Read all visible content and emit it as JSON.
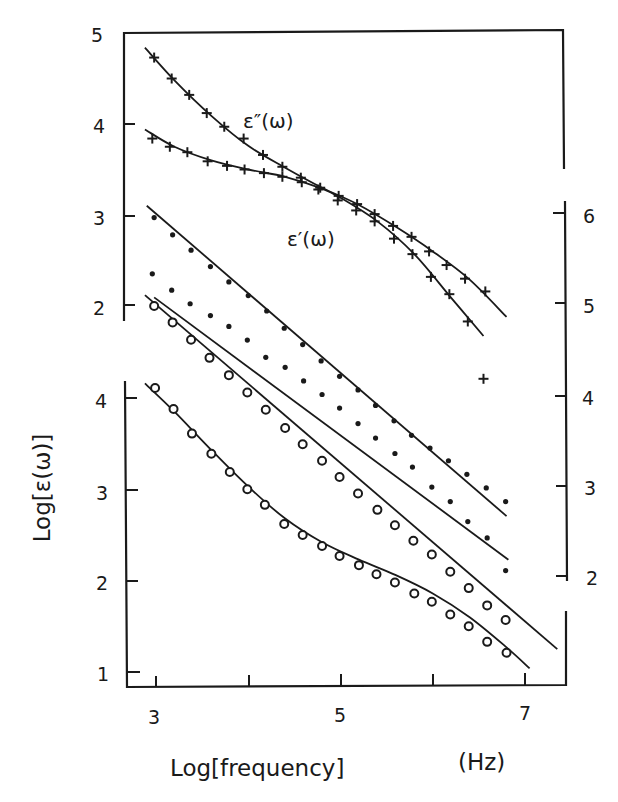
{
  "chart_data": {
    "type": "scatter",
    "title": "",
    "xlabel": "Log[frequency]",
    "xunit": "(Hz)",
    "ylabel": "Log[ε(ω)]",
    "xlim": [
      2.9,
      7.45
    ],
    "x_ticks": [
      3,
      4,
      5,
      6,
      7
    ],
    "x_tick_labels": [
      "3",
      "5",
      "7"
    ],
    "grid": false,
    "legend": "inline curve labels",
    "axes": {
      "left_upper": {
        "ticks": [
          5,
          4,
          3,
          2
        ],
        "labels": [
          "5",
          "4",
          "3",
          "2"
        ],
        "ylim": [
          1.85,
          5
        ]
      },
      "left_lower": {
        "ticks": [
          4,
          3,
          2,
          1
        ],
        "labels": [
          "4",
          "3",
          "2",
          "1"
        ],
        "ylim": [
          0.83,
          4.2
        ]
      },
      "right": {
        "ticks": [
          6,
          5,
          4,
          3,
          2
        ],
        "labels": [
          "6",
          "5",
          "4",
          "3",
          "2"
        ]
      }
    },
    "annotations": [
      "ε″(ω)",
      "ε′(ω)"
    ],
    "series": [
      {
        "name": "ε″(ω)",
        "marker": "cross",
        "axis": "left_upper",
        "x": [
          2.98,
          3.17,
          3.36,
          3.55,
          3.74,
          3.95,
          4.16,
          4.37,
          4.57,
          4.78,
          4.98,
          5.18,
          5.37,
          5.57,
          5.77,
          5.96,
          6.15,
          6.35,
          6.57
        ],
        "y": [
          4.73,
          4.5,
          4.32,
          4.12,
          3.97,
          3.84,
          3.66,
          3.53,
          3.41,
          3.3,
          3.21,
          3.12,
          3.01,
          2.88,
          2.76,
          2.6,
          2.45,
          2.3,
          2.16
        ],
        "fit": {
          "x": [
            2.88,
            3.2,
            3.6,
            4.0,
            4.4,
            4.8,
            5.2,
            5.6,
            6.0,
            6.4,
            6.8
          ],
          "y": [
            4.84,
            4.48,
            4.09,
            3.76,
            3.52,
            3.3,
            3.11,
            2.87,
            2.6,
            2.29,
            1.88
          ]
        }
      },
      {
        "name": "ε′(ω)",
        "marker": "cross",
        "axis": "left_upper",
        "x": [
          2.96,
          3.15,
          3.34,
          3.56,
          3.77,
          3.96,
          4.17,
          4.37,
          4.58,
          4.76,
          4.97,
          5.17,
          5.37,
          5.58,
          5.78,
          5.98,
          6.18,
          6.38,
          6.55
        ],
        "y": [
          3.84,
          3.75,
          3.69,
          3.59,
          3.54,
          3.5,
          3.46,
          3.42,
          3.36,
          3.28,
          3.16,
          3.05,
          2.93,
          2.74,
          2.57,
          2.32,
          2.13,
          1.83,
          1.2
        ],
        "outlier_index": 18,
        "fit": {
          "x": [
            2.88,
            3.2,
            3.6,
            4.0,
            4.4,
            4.8,
            5.0,
            5.4,
            5.8,
            6.2,
            6.55
          ],
          "y": [
            3.94,
            3.75,
            3.6,
            3.5,
            3.42,
            3.29,
            3.19,
            2.93,
            2.57,
            2.09,
            1.67
          ]
        }
      },
      {
        "name": "dots-A",
        "marker": "dot",
        "axis": "right",
        "x": [
          2.98,
          3.18,
          3.38,
          3.59,
          3.79,
          4.0,
          4.2,
          4.39,
          4.59,
          4.79,
          4.99,
          5.19,
          5.38,
          5.58,
          5.77,
          5.97,
          6.17,
          6.37,
          6.58,
          6.79
        ],
        "y": [
          5.95,
          5.76,
          5.59,
          5.41,
          5.24,
          5.09,
          4.92,
          4.73,
          4.55,
          4.37,
          4.2,
          4.05,
          3.88,
          3.71,
          3.55,
          3.41,
          3.27,
          3.12,
          2.97,
          2.82
        ],
        "fit": {
          "x": [
            2.9,
            6.8
          ],
          "y": [
            6.08,
            2.66
          ]
        }
      },
      {
        "name": "dots-B",
        "marker": "dot",
        "axis": "right",
        "x": [
          2.96,
          3.17,
          3.37,
          3.59,
          3.79,
          3.99,
          4.19,
          4.4,
          4.6,
          4.8,
          4.99,
          5.19,
          5.38,
          5.59,
          5.78,
          5.99,
          6.19,
          6.38,
          6.59,
          6.79
        ],
        "y": [
          5.33,
          5.15,
          5.0,
          4.87,
          4.75,
          4.6,
          4.41,
          4.3,
          4.15,
          4.0,
          3.85,
          3.68,
          3.52,
          3.35,
          3.2,
          2.98,
          2.82,
          2.6,
          2.42,
          2.06
        ],
        "fit": {
          "x": [
            2.98,
            6.82
          ],
          "y": [
            5.07,
            2.18
          ]
        }
      },
      {
        "name": "circles-A",
        "marker": "circle",
        "axis": "left_upper",
        "x": [
          2.98,
          3.18,
          3.38,
          3.58,
          3.79,
          3.99,
          4.19,
          4.4,
          4.59,
          4.8,
          4.99,
          5.19,
          5.4,
          5.59,
          5.79,
          5.99,
          6.19,
          6.39,
          6.59,
          6.79
        ],
        "y": [
          2.0,
          1.82,
          1.63,
          1.43,
          1.24,
          1.05,
          0.86,
          0.66,
          0.48,
          0.3,
          0.12,
          -0.06,
          -0.24,
          -0.41,
          -0.58,
          -0.73,
          -0.92,
          -1.1,
          -1.29,
          -1.45
        ],
        "fit": {
          "x": [
            2.88,
            7.35
          ],
          "y": [
            2.12,
            -1.77
          ]
        }
      },
      {
        "name": "circles-B",
        "marker": "circle",
        "axis": "left_lower",
        "x": [
          2.99,
          3.19,
          3.39,
          3.6,
          3.8,
          3.99,
          4.18,
          4.39,
          4.59,
          4.8,
          4.99,
          5.2,
          5.39,
          5.59,
          5.8,
          5.99,
          6.19,
          6.39,
          6.59,
          6.8
        ],
        "y": [
          4.11,
          3.88,
          3.61,
          3.39,
          3.19,
          3.0,
          2.83,
          2.62,
          2.5,
          2.38,
          2.27,
          2.17,
          2.07,
          1.98,
          1.86,
          1.77,
          1.63,
          1.5,
          1.33,
          1.21
        ],
        "fit": {
          "x": [
            2.88,
            3.2,
            3.6,
            4.0,
            4.4,
            4.8,
            5.2,
            5.6,
            6.0,
            6.4,
            6.8,
            7.05
          ],
          "y": [
            4.16,
            3.85,
            3.43,
            3.03,
            2.68,
            2.42,
            2.23,
            2.06,
            1.86,
            1.6,
            1.27,
            1.04
          ]
        }
      }
    ]
  },
  "labels": {
    "x_title": "Log[frequency]",
    "x_unit": "(Hz)",
    "y_title": "Log[ε(ω)]",
    "curve_eps2": "ε″(ω)",
    "curve_eps1": "ε′(ω)"
  }
}
